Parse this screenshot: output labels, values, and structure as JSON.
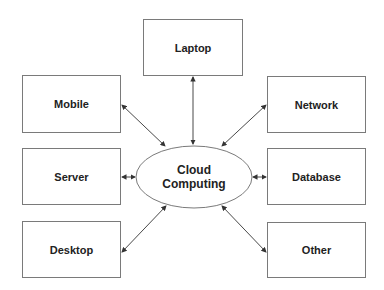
{
  "diagram": {
    "hub": {
      "line1": "Cloud",
      "line2": "Computing",
      "cx": 194,
      "cy": 177,
      "rx": 58,
      "ry": 31
    },
    "nodes": [
      {
        "id": "laptop",
        "label": "Laptop",
        "x": 143,
        "y": 19,
        "w": 100,
        "h": 57
      },
      {
        "id": "mobile",
        "label": "Mobile",
        "x": 22,
        "y": 75,
        "w": 99,
        "h": 58
      },
      {
        "id": "network",
        "label": "Network",
        "x": 267,
        "y": 76,
        "w": 99,
        "h": 57
      },
      {
        "id": "server",
        "label": "Server",
        "x": 22,
        "y": 148,
        "w": 99,
        "h": 57
      },
      {
        "id": "database",
        "label": "Database",
        "x": 267,
        "y": 148,
        "w": 99,
        "h": 57
      },
      {
        "id": "desktop",
        "label": "Desktop",
        "x": 22,
        "y": 221,
        "w": 99,
        "h": 57
      },
      {
        "id": "other",
        "label": "Other",
        "x": 267,
        "y": 222,
        "w": 99,
        "h": 56
      }
    ],
    "edges": [
      {
        "from": "laptop",
        "to": "hub",
        "x1": 193,
        "y1": 77,
        "x2": 193,
        "y2": 144
      },
      {
        "from": "mobile",
        "to": "hub",
        "x1": 122,
        "y1": 105,
        "x2": 165,
        "y2": 146
      },
      {
        "from": "network",
        "to": "hub",
        "x1": 266,
        "y1": 105,
        "x2": 222,
        "y2": 146
      },
      {
        "from": "server",
        "to": "hub",
        "x1": 122,
        "y1": 177,
        "x2": 135,
        "y2": 177
      },
      {
        "from": "database",
        "to": "hub",
        "x1": 266,
        "y1": 177,
        "x2": 253,
        "y2": 177
      },
      {
        "from": "desktop",
        "to": "hub",
        "x1": 122,
        "y1": 252,
        "x2": 166,
        "y2": 206
      },
      {
        "from": "other",
        "to": "hub",
        "x1": 266,
        "y1": 252,
        "x2": 222,
        "y2": 206
      }
    ],
    "colors": {
      "stroke": "#7a7a7a",
      "arrow": "#333333",
      "text": "#222222"
    }
  }
}
